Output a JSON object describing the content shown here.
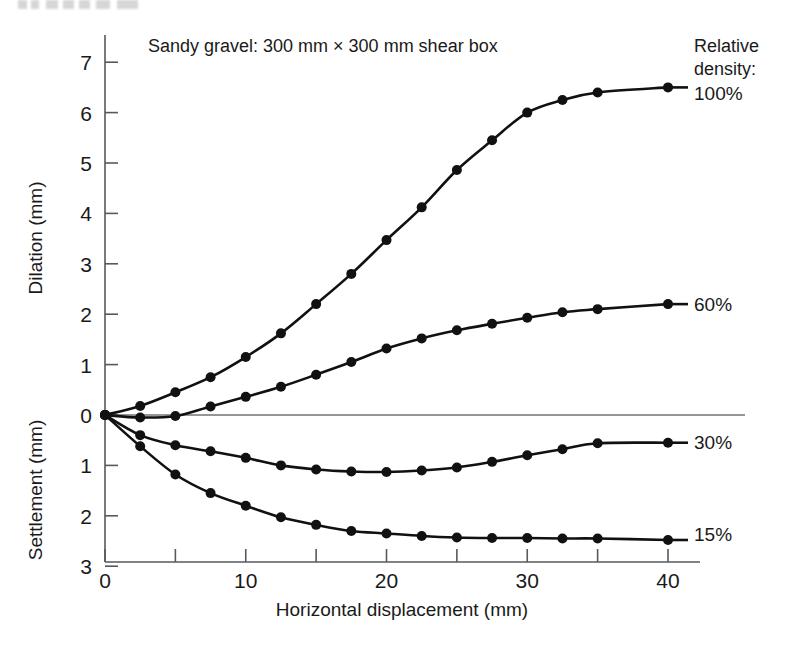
{
  "figure": {
    "annotation": "Sandy gravel: 300 mm × 300 mm shear box",
    "legend_title_line1": "Relative",
    "legend_title_line2": "density:"
  },
  "axes": {
    "x_title": "Horizontal displacement (mm)",
    "y_title_upper": "Dilation (mm)",
    "y_title_lower": "Settlement (mm)",
    "x_ticks": [
      "0",
      "10",
      "20",
      "30",
      "40"
    ],
    "y_ticks_upper": [
      "0",
      "1",
      "2",
      "3",
      "4",
      "5",
      "6",
      "7"
    ],
    "y_ticks_lower": [
      "1",
      "2",
      "3"
    ]
  },
  "series_labels": {
    "s100": "100%",
    "s60": "60%",
    "s30": "30%",
    "s15": "15%"
  },
  "chart_data": {
    "type": "line",
    "title": "Sandy gravel: 300 mm × 300 mm shear box",
    "xlabel": "Horizontal displacement (mm)",
    "ylabel": "Dilation (mm) / Settlement (mm)",
    "xlim": [
      0,
      40
    ],
    "ylim": [
      -3,
      7.4
    ],
    "grid": false,
    "legend_position": "right",
    "legend_title": "Relative density:",
    "note": "Positive values are dilation (mm); negative values are settlement (mm).",
    "series": [
      {
        "name": "100%",
        "x": [
          0,
          2.5,
          5,
          7.5,
          10,
          12.5,
          15,
          17.5,
          20,
          22.5,
          25,
          27.5,
          30,
          32.5,
          35,
          40
        ],
        "y": [
          0,
          0.18,
          0.45,
          0.75,
          1.15,
          1.62,
          2.2,
          2.8,
          3.47,
          4.12,
          4.86,
          5.45,
          6.0,
          6.25,
          6.4,
          6.5
        ]
      },
      {
        "name": "60%",
        "x": [
          0,
          2.5,
          5,
          7.5,
          10,
          12.5,
          15,
          17.5,
          20,
          22.5,
          25,
          27.5,
          30,
          32.5,
          35,
          40
        ],
        "y": [
          0,
          -0.05,
          -0.02,
          0.17,
          0.36,
          0.56,
          0.8,
          1.05,
          1.32,
          1.52,
          1.68,
          1.81,
          1.93,
          2.04,
          2.1,
          2.2
        ]
      },
      {
        "name": "30%",
        "x": [
          0,
          2.5,
          5,
          7.5,
          10,
          12.5,
          15,
          17.5,
          20,
          22.5,
          25,
          27.5,
          30,
          32.5,
          35,
          40
        ],
        "y": [
          0,
          -0.4,
          -0.6,
          -0.72,
          -0.85,
          -1.0,
          -1.08,
          -1.12,
          -1.13,
          -1.1,
          -1.04,
          -0.93,
          -0.8,
          -0.68,
          -0.56,
          -0.55
        ]
      },
      {
        "name": "15%",
        "x": [
          0,
          2.5,
          5,
          7.5,
          10,
          12.5,
          15,
          17.5,
          20,
          22.5,
          25,
          27.5,
          30,
          32.5,
          35,
          40
        ],
        "y": [
          0,
          -0.62,
          -1.18,
          -1.55,
          -1.8,
          -2.03,
          -2.18,
          -2.3,
          -2.35,
          -2.4,
          -2.43,
          -2.44,
          -2.44,
          -2.45,
          -2.45,
          -2.48
        ]
      }
    ]
  }
}
